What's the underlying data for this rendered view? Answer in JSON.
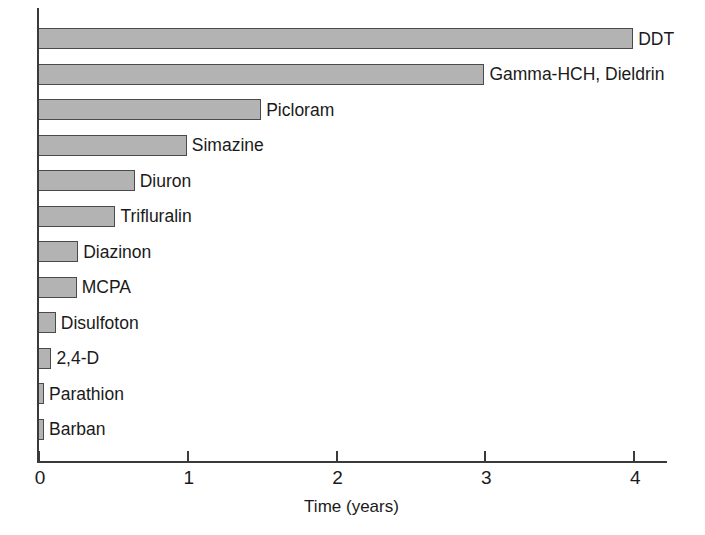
{
  "chart_data": {
    "type": "bar",
    "orientation": "horizontal",
    "title": "",
    "xlabel": "Time (years)",
    "ylabel": "",
    "xlim": [
      0,
      4.22
    ],
    "xticks": [
      0,
      1,
      2,
      3,
      4
    ],
    "xtick_labels": [
      "0",
      "1",
      "2",
      "3",
      "4"
    ],
    "grid": false,
    "legend": false,
    "bar_fill_color": "#b3b3b3",
    "bar_edge_color": "#4a4a4a",
    "axis_color": "#3a3a3a",
    "categories": [
      "DDT",
      "Gamma-HCH, Dieldrin",
      "Picloram",
      "Simazine",
      "Diuron",
      "Trifluralin",
      "Diazinon",
      "MCPA",
      "Disulfoton",
      "2,4-D",
      "Parathion",
      "Barban"
    ],
    "values": [
      4.0,
      3.0,
      1.5,
      1.0,
      0.65,
      0.52,
      0.27,
      0.26,
      0.12,
      0.09,
      0.04,
      0.04
    ],
    "bars": [
      {
        "label": "DDT",
        "value": 4.0
      },
      {
        "label": "Gamma-HCH, Dieldrin",
        "value": 3.0
      },
      {
        "label": "Picloram",
        "value": 1.5
      },
      {
        "label": "Simazine",
        "value": 1.0
      },
      {
        "label": "Diuron",
        "value": 0.65
      },
      {
        "label": "Trifluralin",
        "value": 0.52
      },
      {
        "label": "Diazinon",
        "value": 0.27
      },
      {
        "label": "MCPA",
        "value": 0.26
      },
      {
        "label": "Disulfoton",
        "value": 0.12
      },
      {
        "label": "2,4-D",
        "value": 0.09
      },
      {
        "label": "Parathion",
        "value": 0.04
      },
      {
        "label": "Barban",
        "value": 0.04
      }
    ]
  }
}
